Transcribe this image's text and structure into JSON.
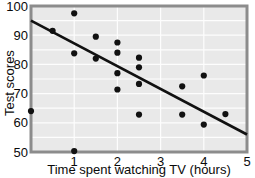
{
  "chart_data": {
    "type": "scatter",
    "title": "",
    "xlabel": "Time spent watching TV (hours)",
    "ylabel": "Test scores",
    "xlim": [
      0,
      5
    ],
    "ylim": [
      50,
      100
    ],
    "xticks": [
      1,
      2,
      3,
      4,
      5
    ],
    "xtick_labels": [
      "1",
      "2",
      "3",
      "4",
      "5"
    ],
    "yticks": [
      50,
      60,
      70,
      80,
      90,
      100
    ],
    "ytick_labels": [
      "50",
      "60",
      "70",
      "80",
      "90",
      "100"
    ],
    "grid": true,
    "grid_color": "#fdfdfd",
    "plot_background": "#e9e9e9",
    "legend": null,
    "point_color": "#111111",
    "line_color": "#111111",
    "points": [
      {
        "x": 0.0,
        "y": 64.0
      },
      {
        "x": 0.5,
        "y": 91.5
      },
      {
        "x": 1.0,
        "y": 97.5
      },
      {
        "x": 1.0,
        "y": 83.8
      },
      {
        "x": 1.0,
        "y": 50.3
      },
      {
        "x": 1.5,
        "y": 89.5
      },
      {
        "x": 1.5,
        "y": 82.0
      },
      {
        "x": 2.0,
        "y": 87.5
      },
      {
        "x": 2.0,
        "y": 84.0
      },
      {
        "x": 2.0,
        "y": 77.0
      },
      {
        "x": 2.0,
        "y": 71.4
      },
      {
        "x": 2.5,
        "y": 82.3
      },
      {
        "x": 2.5,
        "y": 79.0
      },
      {
        "x": 2.5,
        "y": 73.3
      },
      {
        "x": 2.5,
        "y": 62.8
      },
      {
        "x": 3.5,
        "y": 72.5
      },
      {
        "x": 3.5,
        "y": 62.8
      },
      {
        "x": 4.0,
        "y": 76.2
      },
      {
        "x": 4.0,
        "y": 59.4
      },
      {
        "x": 4.5,
        "y": 63.0
      }
    ],
    "trend_line": {
      "x_start": 0.0,
      "y_start": 95.0,
      "x_end": 5.0,
      "y_end": 56.0
    }
  }
}
